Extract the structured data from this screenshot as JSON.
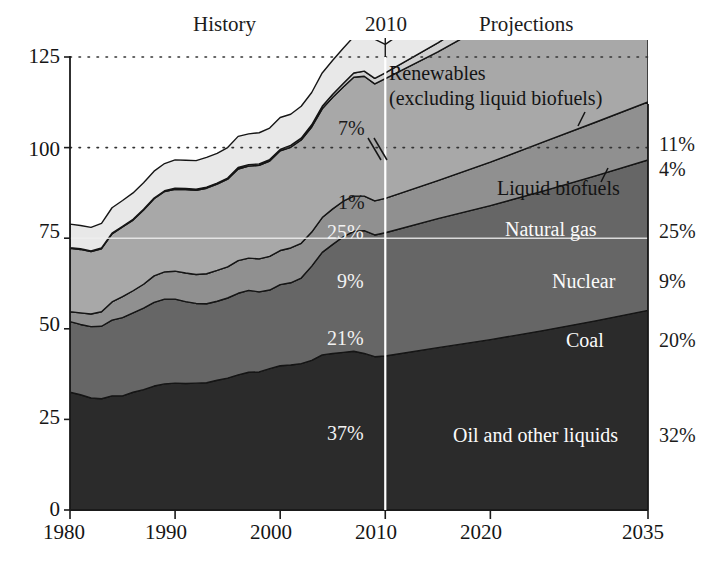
{
  "chart_data": {
    "type": "area",
    "title": "",
    "xlabel": "",
    "ylabel": "",
    "xlim": [
      1980,
      2035
    ],
    "ylim": [
      0,
      125
    ],
    "grid": "dotted horizontal gridlines at 100 and 125",
    "legend_position": "inline right-side labels",
    "x_ticks": [
      "1980",
      "1990",
      "2000",
      "2010",
      "2020",
      "2035"
    ],
    "y_ticks": [
      "0",
      "25",
      "50",
      "75",
      "100",
      "125"
    ],
    "divider_year": 2010,
    "period_labels": {
      "history": "History",
      "divider": "2010",
      "projections": "Projections"
    },
    "annotations": {
      "renewables_line1": "Renewables",
      "renewables_line2": "(excluding liquid biofuels)",
      "liquid_biofuels": "Liquid biofuels"
    },
    "series": [
      {
        "name": "Oil and other liquids",
        "label_inside": "Oil and other liquids",
        "label_style": "light",
        "pct_2010": "37%",
        "pct_2035": "32%",
        "color": "#2b2b2b",
        "x": [
          1980,
          1981,
          1982,
          1983,
          1984,
          1985,
          1986,
          1987,
          1988,
          1989,
          1990,
          1991,
          1992,
          1993,
          1994,
          1995,
          1996,
          1997,
          1998,
          1999,
          2000,
          2001,
          2002,
          2003,
          2004,
          2005,
          2006,
          2007,
          2008,
          2009,
          2010,
          2015,
          2020,
          2025,
          2030,
          2035
        ],
        "values": [
          32.5,
          31.8,
          30.9,
          30.7,
          31.5,
          31.5,
          32.5,
          33.2,
          34.2,
          34.8,
          35.0,
          34.9,
          35.0,
          35.1,
          35.8,
          36.4,
          37.3,
          38.0,
          38.1,
          39.0,
          39.8,
          40.0,
          40.4,
          41.3,
          42.8,
          43.2,
          43.5,
          43.8,
          43.2,
          42.3,
          42.5,
          44.8,
          47.0,
          49.5,
          52.2,
          55.1
        ]
      },
      {
        "name": "Coal",
        "label_inside": "Coal",
        "label_style": "light",
        "pct_2010": "21%",
        "pct_2035": "20%",
        "color": "#666666",
        "x": [
          1980,
          1981,
          1982,
          1983,
          1984,
          1985,
          1986,
          1987,
          1988,
          1989,
          1990,
          1991,
          1992,
          1993,
          1994,
          1995,
          1996,
          1997,
          1998,
          1999,
          2000,
          2001,
          2002,
          2003,
          2004,
          2005,
          2006,
          2007,
          2008,
          2009,
          2010,
          2015,
          2020,
          2025,
          2030,
          2035
        ],
        "values": [
          19.5,
          19.4,
          19.7,
          20.0,
          20.9,
          21.6,
          21.9,
          22.5,
          23.1,
          23.4,
          23.2,
          22.6,
          22.0,
          21.8,
          21.8,
          22.1,
          22.5,
          22.6,
          22.1,
          21.7,
          22.4,
          22.7,
          23.6,
          26.0,
          28.3,
          30.1,
          31.9,
          33.1,
          33.9,
          33.6,
          34.0,
          35.6,
          37.0,
          38.5,
          40.0,
          41.5
        ]
      },
      {
        "name": "Nuclear",
        "label_inside": "Nuclear",
        "label_style": "light",
        "pct_2010": "9%",
        "pct_2035": "9%",
        "color": "#909090",
        "x": [
          1980,
          1981,
          1982,
          1983,
          1984,
          1985,
          1986,
          1987,
          1988,
          1989,
          1990,
          1991,
          1992,
          1993,
          1994,
          1995,
          1996,
          1997,
          1998,
          1999,
          2000,
          2001,
          2002,
          2003,
          2004,
          2005,
          2006,
          2007,
          2008,
          2009,
          2010,
          2015,
          2020,
          2025,
          2030,
          2035
        ],
        "values": [
          2.7,
          3.2,
          3.5,
          4.0,
          5.0,
          5.8,
          6.1,
          6.6,
          7.3,
          7.5,
          7.7,
          7.9,
          8.0,
          8.3,
          8.5,
          8.6,
          9.0,
          8.9,
          9.1,
          9.3,
          9.4,
          9.6,
          9.6,
          9.4,
          9.6,
          9.8,
          9.8,
          9.7,
          9.5,
          9.4,
          9.5,
          10.5,
          12.0,
          13.5,
          14.8,
          16.0
        ]
      },
      {
        "name": "Natural gas",
        "label_inside": "Natural gas",
        "label_style": "light",
        "pct_2010": "25%",
        "pct_2035": "25%",
        "color": "#a8a8a8",
        "x": [
          1980,
          1981,
          1982,
          1983,
          1984,
          1985,
          1986,
          1987,
          1988,
          1989,
          1990,
          1991,
          1992,
          1993,
          1994,
          1995,
          1996,
          1997,
          1998,
          1999,
          2000,
          2001,
          2002,
          2003,
          2004,
          2005,
          2006,
          2007,
          2008,
          2009,
          2010,
          2015,
          2020,
          2025,
          2030,
          2035
        ],
        "values": [
          17.5,
          17.5,
          17.2,
          17.4,
          18.8,
          19.2,
          19.5,
          20.5,
          21.3,
          22.2,
          22.6,
          23.0,
          23.2,
          23.6,
          23.8,
          24.2,
          25.3,
          25.4,
          25.8,
          26.3,
          27.5,
          27.8,
          28.5,
          29.0,
          30.0,
          30.8,
          31.5,
          32.8,
          33.1,
          32.3,
          33.0,
          35.5,
          38.5,
          41.0,
          43.2,
          45.5
        ]
      },
      {
        "name": "Liquid biofuels",
        "label_inside": "",
        "label_style": "dark",
        "pct_2010": "1%",
        "pct_2035": "4%",
        "color": "#d0d0d0",
        "x": [
          1980,
          1981,
          1982,
          1983,
          1984,
          1985,
          1986,
          1987,
          1988,
          1989,
          1990,
          1991,
          1992,
          1993,
          1994,
          1995,
          1996,
          1997,
          1998,
          1999,
          2000,
          2001,
          2002,
          2003,
          2004,
          2005,
          2006,
          2007,
          2008,
          2009,
          2010,
          2015,
          2020,
          2025,
          2030,
          2035
        ],
        "values": [
          0.2,
          0.2,
          0.2,
          0.2,
          0.2,
          0.2,
          0.2,
          0.2,
          0.2,
          0.2,
          0.3,
          0.3,
          0.3,
          0.3,
          0.3,
          0.3,
          0.4,
          0.4,
          0.4,
          0.4,
          0.4,
          0.5,
          0.5,
          0.6,
          0.7,
          0.8,
          1.0,
          1.2,
          1.4,
          1.5,
          1.6,
          2.5,
          3.5,
          4.6,
          5.8,
          6.8
        ]
      },
      {
        "name": "Renewables (excluding liquid biofuels)",
        "label_inside": "",
        "label_style": "dark",
        "pct_2010": "7%",
        "pct_2035": "11%",
        "color": "#e8e8e8",
        "x": [
          1980,
          1981,
          1982,
          1983,
          1984,
          1985,
          1986,
          1987,
          1988,
          1989,
          1990,
          1991,
          1992,
          1993,
          1994,
          1995,
          1996,
          1997,
          1998,
          1999,
          2000,
          2001,
          2002,
          2003,
          2004,
          2005,
          2006,
          2007,
          2008,
          2009,
          2010,
          2015,
          2020,
          2025,
          2030,
          2035
        ],
        "values": [
          6.5,
          6.4,
          6.5,
          6.8,
          7.0,
          7.1,
          7.3,
          7.3,
          7.4,
          7.5,
          7.8,
          7.8,
          7.9,
          8.2,
          8.2,
          8.4,
          8.6,
          8.5,
          8.6,
          8.7,
          8.8,
          8.6,
          8.8,
          8.9,
          9.2,
          9.4,
          9.7,
          10.0,
          10.6,
          10.8,
          7.9,
          9.5,
          11.0,
          12.6,
          14.2,
          16.0
        ]
      }
    ]
  },
  "axis": {
    "y_ticks": [
      {
        "label": "125",
        "value": 125
      },
      {
        "label": "100",
        "value": 100
      },
      {
        "label": "75",
        "value": 75
      },
      {
        "label": "50",
        "value": 50
      },
      {
        "label": "25",
        "value": 25
      },
      {
        "label": "0",
        "value": 0
      }
    ],
    "x_ticks": [
      {
        "label": "1980",
        "value": 1980
      },
      {
        "label": "1990",
        "value": 1990
      },
      {
        "label": "2000",
        "value": 2000
      },
      {
        "label": "2010",
        "value": 2010
      },
      {
        "label": "2020",
        "value": 2020
      },
      {
        "label": "2035",
        "value": 2035
      }
    ]
  },
  "header": {
    "history": "History",
    "year_divider": "2010",
    "projections": "Projections"
  },
  "callouts": {
    "renewables_line1": "Renewables",
    "renewables_line2": "(excluding liquid biofuels)",
    "liquid_biofuels": "Liquid biofuels"
  },
  "inline_labels": {
    "natural_gas": "Natural gas",
    "nuclear": "Nuclear",
    "coal": "Coal",
    "oil": "Oil and other liquids"
  },
  "pct_2010": {
    "renewables": "7%",
    "biofuels": "1%",
    "natural_gas": "25%",
    "nuclear": "9%",
    "coal": "21%",
    "oil": "37%"
  },
  "pct_2035": {
    "renewables": "11%",
    "biofuels": "4%",
    "natural_gas": "25%",
    "nuclear": "9%",
    "coal": "20%",
    "oil": "32%"
  },
  "colors": {
    "renewables": "#e8e8e8",
    "biofuels": "#d0d0d0",
    "natural_gas": "#a8a8a8",
    "nuclear": "#909090",
    "coal": "#666666",
    "oil": "#2b2b2b",
    "axis": "#1a1a1a",
    "divider": "#ffffff"
  }
}
